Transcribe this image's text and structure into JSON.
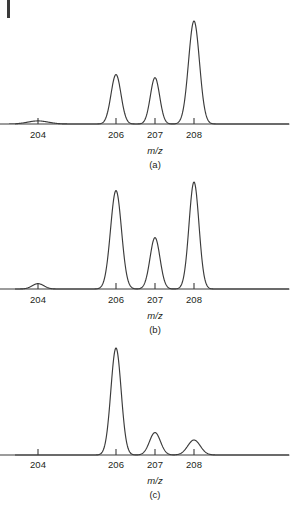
{
  "figure": {
    "background_color": "#ffffff",
    "line_color": "#3b3b3b",
    "text_color": "#231f20",
    "corner_rule": "page-edge-rule"
  },
  "panels": [
    {
      "id": "a",
      "caption": "(a)",
      "axis_title": "m/z",
      "tick_labels": [
        "204",
        "206",
        "207",
        "208"
      ],
      "tick_values": [
        204,
        206,
        207,
        208
      ]
    },
    {
      "id": "b",
      "caption": "(b)",
      "axis_title": "m/z",
      "tick_labels": [
        "204",
        "206",
        "207",
        "208"
      ],
      "tick_values": [
        204,
        206,
        207,
        208
      ]
    },
    {
      "id": "c",
      "caption": "(c)",
      "axis_title": "m/z",
      "tick_labels": [
        "204",
        "206",
        "207",
        "208"
      ],
      "tick_values": [
        204,
        206,
        207,
        208
      ]
    }
  ],
  "chart_data": [
    {
      "type": "line",
      "title": "(a)",
      "xlabel": "m/z",
      "ylabel": "",
      "xlim": [
        202.8,
        209.6
      ],
      "ylim": [
        0,
        100
      ],
      "xticks": [
        204,
        206,
        207,
        208
      ],
      "xticklabels": [
        "204",
        "206",
        "207",
        "208"
      ],
      "grid": false,
      "legend": "none",
      "series": [
        {
          "name": "lead isotope abundance",
          "peaks": [
            {
              "mz": 204,
              "height": 3,
              "width": 0.62
            },
            {
              "mz": 206,
              "height": 48,
              "width": 0.3
            },
            {
              "mz": 207,
              "height": 45,
              "width": 0.28
            },
            {
              "mz": 208,
              "height": 100,
              "width": 0.33
            }
          ]
        }
      ]
    },
    {
      "type": "line",
      "title": "(b)",
      "xlabel": "m/z",
      "ylabel": "",
      "xlim": [
        202.8,
        209.6
      ],
      "ylim": [
        0,
        100
      ],
      "xticks": [
        204,
        206,
        207,
        208
      ],
      "xticklabels": [
        "204",
        "206",
        "207",
        "208"
      ],
      "grid": false,
      "legend": "none",
      "series": [
        {
          "name": "lead isotope abundance",
          "peaks": [
            {
              "mz": 204,
              "height": 5,
              "width": 0.35
            },
            {
              "mz": 206,
              "height": 92,
              "width": 0.33
            },
            {
              "mz": 207,
              "height": 48,
              "width": 0.3
            },
            {
              "mz": 208,
              "height": 100,
              "width": 0.3
            }
          ]
        }
      ]
    },
    {
      "type": "line",
      "title": "(c)",
      "xlabel": "m/z",
      "ylabel": "",
      "xlim": [
        202.8,
        209.6
      ],
      "ylim": [
        0,
        100
      ],
      "xticks": [
        204,
        206,
        207,
        208
      ],
      "xticklabels": [
        "204",
        "206",
        "207",
        "208"
      ],
      "grid": false,
      "legend": "none",
      "series": [
        {
          "name": "lead isotope abundance",
          "peaks": [
            {
              "mz": 204,
              "height": 0,
              "width": 0.4
            },
            {
              "mz": 206,
              "height": 100,
              "width": 0.31
            },
            {
              "mz": 207,
              "height": 21,
              "width": 0.33
            },
            {
              "mz": 208,
              "height": 14,
              "width": 0.38
            }
          ]
        }
      ]
    }
  ]
}
